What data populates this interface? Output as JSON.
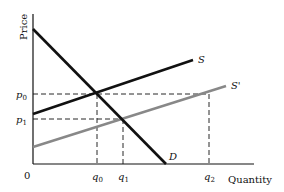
{
  "diagram": {
    "y_axis_label": "Price",
    "x_axis_label": "Quantity",
    "origin_label": "0",
    "curves": {
      "demand": {
        "label": "D",
        "color": "#111111"
      },
      "supply": {
        "label": "S",
        "color": "#111111"
      },
      "supply_shifted": {
        "label": "S'",
        "color": "#888888"
      }
    },
    "price_ticks": [
      {
        "base": "p",
        "sub": "0"
      },
      {
        "base": "p",
        "sub": "1"
      }
    ],
    "quantity_ticks": [
      {
        "base": "q",
        "sub": "0"
      },
      {
        "base": "q",
        "sub": "1"
      },
      {
        "base": "q",
        "sub": "2"
      }
    ]
  }
}
